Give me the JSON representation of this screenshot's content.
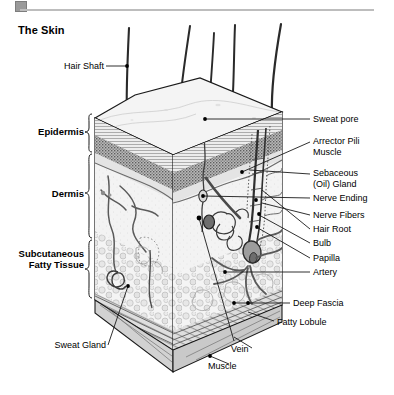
{
  "document": {
    "title": "The Skin",
    "background_color": "#ffffff",
    "ink_color": "#000000"
  },
  "top_bar": {
    "tab_color": "#9a9a9a",
    "rule_color": "#bdbdbd"
  },
  "layer_labels": [
    {
      "id": "epidermis",
      "text": "Epidermis",
      "bold": true
    },
    {
      "id": "dermis",
      "text": "Dermis",
      "bold": true
    },
    {
      "id": "subcutaneous",
      "text": "Subcutaneous\nFatty Tissue",
      "bold": true,
      "line1": "Subcutaneous",
      "line2": "Fatty Tissue"
    }
  ],
  "callouts": {
    "hair_shaft": "Hair Shaft",
    "sweat_pore": "Sweat pore",
    "arrector_1": "Arrector Pili",
    "arrector_2": "Muscle",
    "sebaceous_1": "Sebaceous",
    "sebaceous_2": "(Oil) Gland",
    "nerve_ending": "Nerve Ending",
    "nerve_fibers": "Nerve Fibers",
    "hair_root": "Hair Root",
    "bulb": "Bulb",
    "papilla": "Papilla",
    "artery": "Artery",
    "deep_fascia": "Deep Fascia",
    "fatty_lobule": "Fatty Lobule",
    "sweat_gland": "Sweat Gland",
    "vein": "Vein",
    "muscle": "Muscle"
  },
  "illustration": {
    "kind": "cutaway-block-diagram",
    "subject": "cross-section of human skin",
    "style": "black-and-white engraved line art with stipple shading",
    "structures": [
      "hair shafts",
      "epidermis stratified band",
      "granular layer",
      "dermis",
      "sweat duct",
      "sweat gland coil",
      "sebaceous gland",
      "arrector pili muscle",
      "hair follicle",
      "hair root",
      "bulb",
      "papilla",
      "nerve endings",
      "nerve fibers",
      "artery",
      "vein",
      "subcutaneous fat lobules",
      "deep fascia",
      "skeletal muscle"
    ],
    "tones": {
      "top_surface": "#f2f2f2",
      "epidermis_light": "#e6e6e6",
      "epidermis_dark": "#8f8f8f",
      "dermis": "#f0f0f0",
      "fat": "#ebebeb",
      "muscle": "#d8d8d8",
      "outline": "#1a1a1a"
    }
  }
}
